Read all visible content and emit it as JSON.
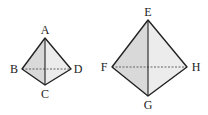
{
  "figures": [
    {
      "name": "small-quadrilateral",
      "vertices": {
        "A": {
          "label": "A",
          "x": 45,
          "y": 38,
          "lx": 45,
          "ly": 34
        },
        "B": {
          "label": "B",
          "x": 22,
          "y": 69,
          "lx": 14,
          "ly": 73
        },
        "C": {
          "label": "C",
          "x": 45,
          "y": 85,
          "lx": 45,
          "ly": 98
        },
        "D": {
          "label": "D",
          "x": 71,
          "y": 69,
          "lx": 78,
          "ly": 73
        }
      },
      "solid_diagonal": [
        "A",
        "C"
      ],
      "dashed_diagonal": [
        "B",
        "D"
      ]
    },
    {
      "name": "large-quadrilateral",
      "vertices": {
        "E": {
          "label": "E",
          "x": 148,
          "y": 20,
          "lx": 148,
          "ly": 16
        },
        "F": {
          "label": "F",
          "x": 112,
          "y": 67,
          "lx": 104,
          "ly": 71
        },
        "G": {
          "label": "G",
          "x": 148,
          "y": 96,
          "lx": 148,
          "ly": 109
        },
        "H": {
          "label": "H",
          "x": 187,
          "y": 67,
          "lx": 196,
          "ly": 71
        }
      },
      "solid_diagonal": [
        "E",
        "G"
      ],
      "dashed_diagonal": [
        "F",
        "H"
      ]
    }
  ],
  "colors": {
    "fill_left": "#d9d9d9",
    "fill_right": "#ececec",
    "stroke": "#222222",
    "dash": "#555555"
  }
}
